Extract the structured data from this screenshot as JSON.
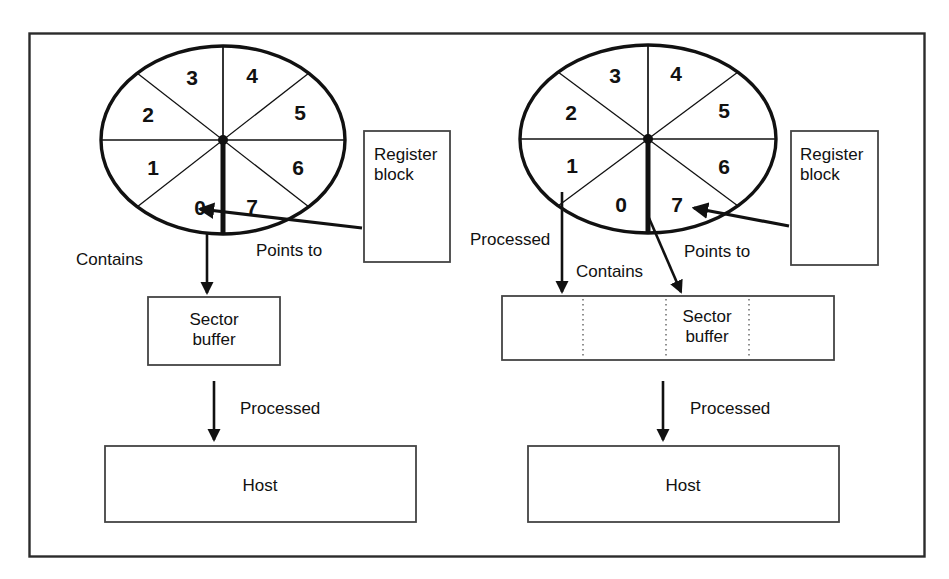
{
  "figure": {
    "frame_color": "#2b2b2b",
    "background_color": "#ffffff",
    "ink_color": "#111111"
  },
  "panels": [
    {
      "id": "left",
      "name": "single-sector-buffer",
      "wheel": {
        "name": "sector-wheel-left",
        "sectors": [
          "0",
          "1",
          "2",
          "3",
          "4",
          "5",
          "6",
          "7"
        ],
        "pointer_sector": "0",
        "pointer_note": "bold radius drawn straight down, between sector 0 and sector 7"
      },
      "register_block": {
        "label": "Register\nblock",
        "line1": "Register",
        "line2": "block"
      },
      "buffer": {
        "label": "Sector\nbuffer",
        "line1": "Sector",
        "line2": "buffer",
        "cells": 1
      },
      "host": {
        "label": "Host"
      },
      "edges": [
        {
          "name": "contains",
          "label": "Contains",
          "from": "wheel",
          "to": "sector-buffer"
        },
        {
          "name": "points-to",
          "label": "Points  to",
          "from": "register-block",
          "to": "wheel-sector-0"
        },
        {
          "name": "processed",
          "label": "Processed",
          "from": "sector-buffer",
          "to": "host"
        }
      ]
    },
    {
      "id": "right",
      "name": "multi-sector-buffer",
      "wheel": {
        "name": "sector-wheel-right",
        "sectors": [
          "0",
          "1",
          "2",
          "3",
          "4",
          "5",
          "6",
          "7"
        ],
        "pointer_sector": "7",
        "pointer_note": "bold radius drawn straight down, between sector 0 and sector 7"
      },
      "register_block": {
        "label": "Register\nblock",
        "line1": "Register",
        "line2": "block"
      },
      "buffer": {
        "label": "Sector\nbuffer",
        "line1": "Sector",
        "line2": "buffer",
        "cells": 4
      },
      "host": {
        "label": "Host"
      },
      "edges": [
        {
          "name": "processed",
          "label": "Processed",
          "from": "wheel-sector-1",
          "to": "buffer-cell-1"
        },
        {
          "name": "contains",
          "label": "Contains",
          "from": "wheel",
          "to": "buffer"
        },
        {
          "name": "points-to",
          "label": "Points  to",
          "from": "register-block",
          "to": "wheel-sector-7"
        },
        {
          "name": "processed-host",
          "label": "Processed",
          "from": "buffer",
          "to": "host"
        }
      ]
    }
  ],
  "sector_label_positions": {
    "left": [
      {
        "n": "0",
        "x": 200,
        "y": 215
      },
      {
        "n": "1",
        "x": 153,
        "y": 175
      },
      {
        "n": "2",
        "x": 148,
        "y": 122
      },
      {
        "n": "3",
        "x": 192,
        "y": 85
      },
      {
        "n": "4",
        "x": 252,
        "y": 83
      },
      {
        "n": "5",
        "x": 300,
        "y": 120
      },
      {
        "n": "6",
        "x": 298,
        "y": 175
      },
      {
        "n": "7",
        "x": 252,
        "y": 214
      }
    ],
    "right": [
      {
        "n": "0",
        "x": 621,
        "y": 212
      },
      {
        "n": "1",
        "x": 572,
        "y": 173
      },
      {
        "n": "2",
        "x": 571,
        "y": 120
      },
      {
        "n": "3",
        "x": 615,
        "y": 83
      },
      {
        "n": "4",
        "x": 676,
        "y": 81
      },
      {
        "n": "5",
        "x": 724,
        "y": 118
      },
      {
        "n": "6",
        "x": 724,
        "y": 174
      },
      {
        "n": "7",
        "x": 677,
        "y": 212
      }
    ]
  },
  "text_positions": {
    "left_contains": {
      "x": 76,
      "y": 265
    },
    "left_points_to": {
      "x": 256,
      "y": 256
    },
    "left_processed": {
      "x": 240,
      "y": 414
    },
    "right_processed_top": {
      "x": 470,
      "y": 245
    },
    "right_contains": {
      "x": 576,
      "y": 277
    },
    "right_points_to": {
      "x": 684,
      "y": 257
    },
    "right_processed_host": {
      "x": 690,
      "y": 414
    }
  }
}
